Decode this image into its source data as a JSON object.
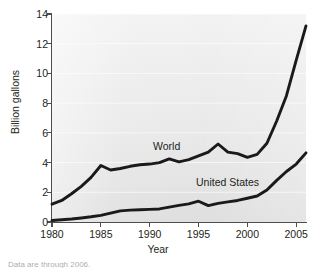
{
  "figure": {
    "name": "ethanol-production-line-chart",
    "caption_fragment": "Data are through 2006."
  },
  "chart_data": {
    "type": "line",
    "title": "",
    "xlabel": "Year",
    "ylabel": "Billion gallons",
    "xlim": [
      1980,
      2006
    ],
    "ylim": [
      0,
      14
    ],
    "xticks": [
      "1980",
      "1985",
      "1990",
      "1995",
      "2000",
      "2005"
    ],
    "yticks": [
      "0",
      "2",
      "4",
      "6",
      "8",
      "10",
      "12",
      "14"
    ],
    "grid": "horizontal",
    "legend": "inline-labels",
    "x": [
      1980,
      1981,
      1982,
      1983,
      1984,
      1985,
      1986,
      1987,
      1988,
      1989,
      1990,
      1991,
      1992,
      1993,
      1994,
      1995,
      1996,
      1997,
      1998,
      1999,
      2000,
      2001,
      2002,
      2003,
      2004,
      2005,
      2006
    ],
    "series": [
      {
        "name": "World",
        "label": "World",
        "color": "#1a1a1a",
        "values": [
          1.2,
          1.45,
          1.9,
          2.4,
          3.0,
          3.8,
          3.5,
          3.6,
          3.75,
          3.85,
          3.9,
          4.0,
          4.25,
          4.05,
          4.2,
          4.45,
          4.7,
          5.25,
          4.7,
          4.6,
          4.35,
          4.55,
          5.3,
          6.8,
          8.5,
          10.9,
          13.2
        ]
      },
      {
        "name": "United States",
        "label": "United States",
        "color": "#1a1a1a",
        "values": [
          0.1,
          0.15,
          0.2,
          0.27,
          0.35,
          0.45,
          0.6,
          0.75,
          0.8,
          0.82,
          0.85,
          0.88,
          1.0,
          1.12,
          1.22,
          1.4,
          1.1,
          1.25,
          1.35,
          1.45,
          1.6,
          1.75,
          2.15,
          2.8,
          3.4,
          3.9,
          4.65
        ]
      }
    ],
    "annotations": [
      {
        "text": "World",
        "x": 1996,
        "y": 5.9
      },
      {
        "text": "United States",
        "x": 2000,
        "y": 3.5
      }
    ]
  }
}
